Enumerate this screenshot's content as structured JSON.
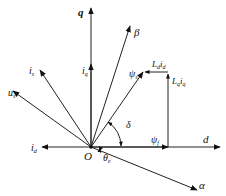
{
  "diagram": {
    "type": "vector-phasor-diagram",
    "origin_label": "O",
    "axes": {
      "d": "d",
      "q": "q",
      "alpha": "α",
      "beta": "β"
    },
    "vectors": {
      "i_s": {
        "base": "i",
        "sub": "s"
      },
      "u_s": {
        "base": "u",
        "sub": "s"
      },
      "i_q": {
        "base": "i",
        "sub": "q"
      },
      "i_d": {
        "base": "i",
        "sub": "d"
      },
      "psi_s": {
        "base": "ψ",
        "sub": "s"
      },
      "psi_f": {
        "base": "ψ",
        "sub": "f"
      },
      "Ld_id": {
        "base": "L",
        "sub1": "d",
        "mid": "i",
        "sub2": "d"
      },
      "Lq_iq": {
        "base": "L",
        "sub1": "q",
        "mid": "i",
        "sub2": "q"
      }
    },
    "angles": {
      "delta": "δ",
      "theta_e": {
        "base": "θ",
        "sub": "e"
      }
    },
    "colors": {
      "line": "#222222",
      "background": "#ffffff"
    }
  }
}
